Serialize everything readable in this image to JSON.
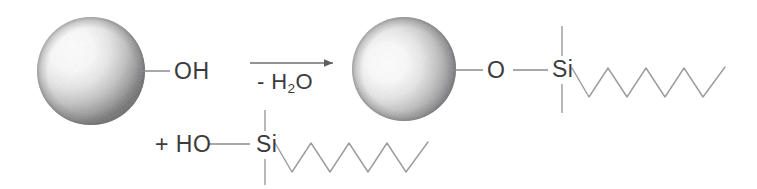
{
  "figure": {
    "type": "chemical-reaction-scheme",
    "background_color": "#ffffff",
    "line_color": "#8a8a90",
    "text_color": "#3b3b3e"
  },
  "reactants": {
    "particle": {
      "name": "substrate-particle",
      "shape": "sphere",
      "surface_group_label": "OH",
      "center": {
        "x": 91,
        "y": 71
      },
      "radius": 54
    },
    "silane": {
      "prefix_label": "+ HO",
      "silicon_label": "Si",
      "chain_type": "zigzag-alkyl",
      "chain_segments": 8
    }
  },
  "arrow": {
    "direction": "right",
    "condition_label_prefix": "-",
    "condition_label_formula": "H",
    "condition_label_subscript": "2",
    "condition_label_suffix": "O",
    "condition_label_full": "- H2O"
  },
  "product": {
    "particle": {
      "name": "substrate-particle",
      "shape": "sphere",
      "center": {
        "x": 404,
        "y": 69
      },
      "radius": 52
    },
    "bridge_label": "O",
    "silicon_label": "Si",
    "chain_type": "zigzag-alkyl",
    "chain_segments": 8
  }
}
